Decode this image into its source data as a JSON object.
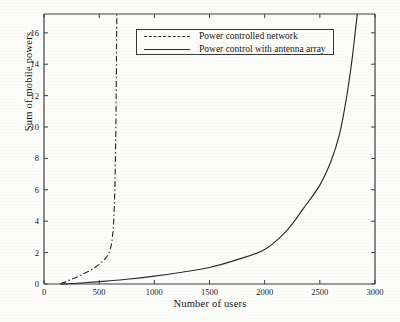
{
  "chart_data": {
    "type": "line",
    "title": "",
    "xlabel": "Number of users",
    "ylabel": "Sum of mobile powers",
    "xlim": [
      0,
      3000
    ],
    "ylim": [
      0,
      17.2
    ],
    "xticks": [
      0,
      500,
      1000,
      1500,
      2000,
      2500,
      3000
    ],
    "yticks": [
      0,
      2,
      4,
      6,
      8,
      10,
      12,
      14,
      16
    ],
    "xtick_labels": [
      "0",
      "500",
      "1000",
      "1500",
      "2000",
      "2500",
      "3000"
    ],
    "ytick_labels": [
      "0",
      "2",
      "4",
      "6",
      "8",
      "10",
      "12",
      "14",
      "16"
    ],
    "grid": false,
    "legend_position": "top-center",
    "line_color": "#2b2b2b",
    "background_color": "#fdfdfc",
    "series": [
      {
        "name": "Power controlled network",
        "style": "dash-dot",
        "x": [
          150,
          200,
          250,
          300,
          350,
          400,
          450,
          500,
          540,
          570,
          600,
          620,
          635,
          645,
          652,
          656,
          658,
          660
        ],
        "y": [
          0.02,
          0.15,
          0.3,
          0.45,
          0.62,
          0.8,
          1.0,
          1.25,
          1.5,
          1.75,
          2.2,
          3.0,
          4.5,
          7.0,
          10.5,
          13.5,
          15.8,
          17.2
        ]
      },
      {
        "name": "Power control with antenna array",
        "style": "solid",
        "x": [
          150,
          300,
          500,
          750,
          1000,
          1250,
          1500,
          1750,
          2000,
          2200,
          2350,
          2500,
          2600,
          2680,
          2740,
          2790,
          2820,
          2840
        ],
        "y": [
          0.0,
          0.05,
          0.15,
          0.3,
          0.5,
          0.75,
          1.05,
          1.55,
          2.2,
          3.4,
          4.8,
          6.3,
          7.8,
          9.6,
          11.8,
          14.2,
          16.0,
          17.2
        ]
      }
    ]
  },
  "legend": {
    "entries": [
      {
        "label": "Power controlled network",
        "style": "dash-dot"
      },
      {
        "label": "Power control with antenna array",
        "style": "solid"
      }
    ]
  }
}
